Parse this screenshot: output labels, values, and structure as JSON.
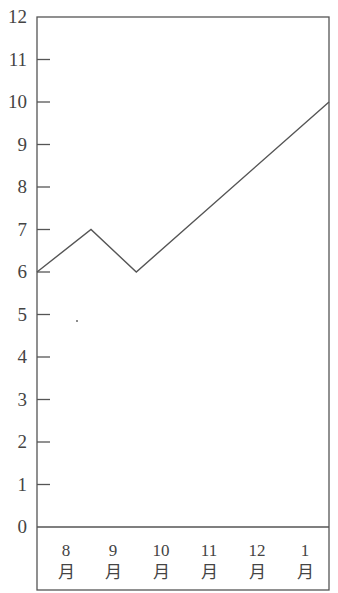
{
  "chart_data": {
    "type": "line",
    "title": "",
    "xlabel": "",
    "ylabel": "",
    "ylim": [
      0,
      12
    ],
    "yticks": [
      0,
      1,
      2,
      3,
      4,
      5,
      6,
      7,
      8,
      9,
      10,
      11,
      12
    ],
    "categories": [
      "8月",
      "9月",
      "10月",
      "11月",
      "12月",
      "1月"
    ],
    "category_labels": [
      {
        "num": "8",
        "unit": "月"
      },
      {
        "num": "9",
        "unit": "月"
      },
      {
        "num": "10",
        "unit": "月"
      },
      {
        "num": "11",
        "unit": "月"
      },
      {
        "num": "12",
        "unit": "月"
      },
      {
        "num": "1",
        "unit": "月"
      }
    ],
    "series": [
      {
        "name": "line",
        "points": [
          {
            "x_frac": 0.0,
            "y": 6
          },
          {
            "x_frac": 0.185,
            "y": 7
          },
          {
            "x_frac": 0.34,
            "y": 6
          },
          {
            "x_frac": 1.0,
            "y": 10
          }
        ]
      }
    ],
    "grid": false,
    "legend": null
  },
  "colors": {
    "axis": "#555555",
    "line": "#555555",
    "text": "#444444"
  }
}
